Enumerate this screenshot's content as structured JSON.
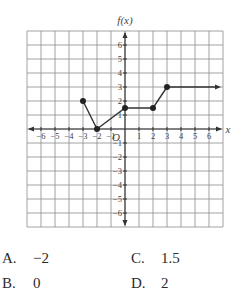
{
  "chart_data": {
    "type": "line",
    "title": "",
    "xlabel": "x",
    "ylabel": "f(x)",
    "xlim": [
      -7,
      7
    ],
    "ylim": [
      -7,
      7
    ],
    "grid": true,
    "x_ticks": [
      -6,
      -5,
      -4,
      -3,
      -2,
      -1,
      1,
      2,
      3,
      4,
      5,
      6
    ],
    "y_ticks": [
      -6,
      -5,
      -4,
      -3,
      -2,
      -1,
      1,
      2,
      3,
      4,
      5,
      6
    ],
    "origin_label": "O",
    "series": [
      {
        "name": "f(x)",
        "points": [
          [
            -3,
            2
          ],
          [
            -2,
            0
          ],
          [
            0,
            1.5
          ],
          [
            2,
            1.5
          ],
          [
            3,
            3
          ]
        ],
        "ray": {
          "from": [
            3,
            3
          ],
          "to": [
            7,
            3
          ],
          "arrow": true
        },
        "closed_points": [
          [
            -3,
            2
          ],
          [
            -2,
            0
          ],
          [
            0,
            1.5
          ],
          [
            2,
            1.5
          ],
          [
            3,
            3
          ]
        ]
      }
    ]
  },
  "answer_choices": [
    {
      "letter": "A.",
      "value": "−2"
    },
    {
      "letter": "B.",
      "value": "0"
    },
    {
      "letter": "C.",
      "value": "1.5"
    },
    {
      "letter": "D.",
      "value": "2"
    }
  ]
}
